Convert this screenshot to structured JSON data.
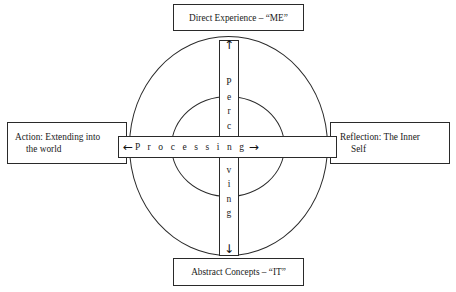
{
  "diagram": {
    "title_top": "Direct Experience – “ME”",
    "title_bottom": "Abstract Concepts – “IT”",
    "left_label_line1": "Action: Extending into",
    "left_label_line2": "the world",
    "right_label_line1": "Reflection: The Inner",
    "right_label_line2": "Self",
    "horizontal_axis_label": "P r o c e s s i n g",
    "horizontal_arrow_left": "←",
    "horizontal_arrow_right": "→",
    "vertical_axis_label": "Perceiving",
    "vertical_arrow_up": "↑",
    "vertical_arrow_down": "↓",
    "vertical_letters": [
      "P",
      "e",
      "r",
      "c",
      "e",
      "i",
      "v",
      "i",
      "n",
      "g"
    ],
    "colors": {
      "background": "#ffffff",
      "stroke": "#2a2a2a",
      "text": "#1a1a1a"
    }
  }
}
